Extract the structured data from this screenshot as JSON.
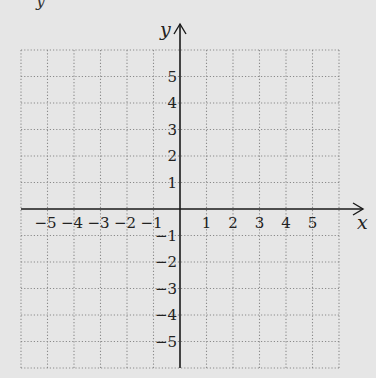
{
  "figure": {
    "type": "coordinate-grid",
    "background": "#e6e6e6",
    "axis_color": "#1a1a1a",
    "grid_color": "#8a8a8a",
    "text_color": "#222222",
    "top_cropped_text": "y",
    "x_axis": {
      "label": "x",
      "range": [
        -6,
        6
      ],
      "ticks": [
        -5,
        -4,
        -3,
        -2,
        -1,
        1,
        2,
        3,
        4,
        5
      ],
      "tick_labels": [
        "−5",
        "−4",
        "−3",
        "−2",
        "−1",
        "1",
        "2",
        "3",
        "4",
        "5"
      ]
    },
    "y_axis": {
      "label": "y",
      "range": [
        -6,
        6
      ],
      "ticks": [
        5,
        4,
        3,
        2,
        1,
        -1,
        -2,
        -3,
        -4,
        -5
      ],
      "tick_labels": [
        "5",
        "4",
        "3",
        "2",
        "1",
        "−1",
        "−2",
        "−3",
        "−4",
        "−5"
      ]
    },
    "grid": {
      "style": "dotted",
      "cols": 12,
      "rows": 12,
      "origin_px": [
        180,
        209
      ],
      "unit_px": 26.5
    }
  }
}
